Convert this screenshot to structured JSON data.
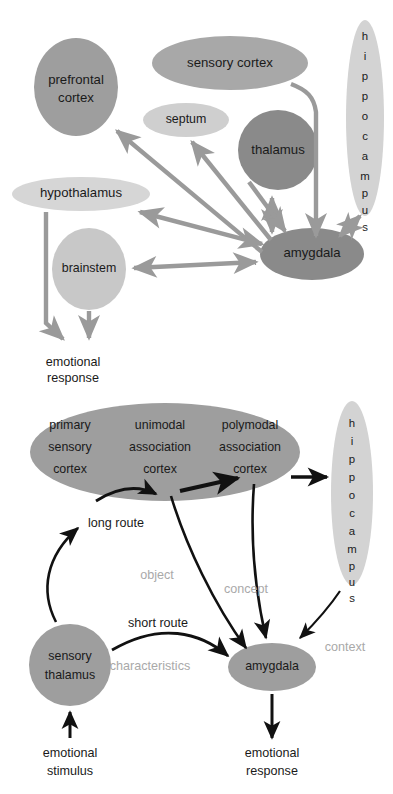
{
  "figure": {
    "panels": [
      {
        "id": "panel-top",
        "name": "limbic-circuit-panel",
        "nodes": [
          {
            "key": "prefrontal_cortex",
            "label_line1": "prefrontal",
            "label_line2": "cortex",
            "shade": "#9e9e9e"
          },
          {
            "key": "sensory_cortex",
            "label_line1": "sensory cortex",
            "label_line2": "",
            "shade": "#a8a8a8"
          },
          {
            "key": "septum",
            "label_line1": "septum",
            "label_line2": "",
            "shade": "#cfcfcf"
          },
          {
            "key": "thalamus",
            "label_line1": "thalamus",
            "label_line2": "",
            "shade": "#8a8a8a"
          },
          {
            "key": "hippocampus",
            "label_line1": "hippocampus",
            "label_line2": "",
            "shade": "#d3d3d3"
          },
          {
            "key": "hypothalamus",
            "label_line1": "hypothalamus",
            "label_line2": "",
            "shade": "#d6d6d6"
          },
          {
            "key": "brainstem",
            "label_line1": "brainstem",
            "label_line2": "",
            "shade": "#c8c8c8"
          },
          {
            "key": "amygdala",
            "label_line1": "amygdala",
            "label_line2": "",
            "shade": "#8a8a8a"
          }
        ],
        "outputs": [
          {
            "key": "emotional_response",
            "line1": "emotional",
            "line2": "response"
          }
        ],
        "arrow_color": "#9a9a9a"
      },
      {
        "id": "panel-bottom",
        "name": "dual-route-panel",
        "cortex_columns": [
          {
            "line1": "primary",
            "line2": "sensory",
            "line3": "cortex"
          },
          {
            "line1": "unimodal",
            "line2": "association",
            "line3": "cortex"
          },
          {
            "line1": "polymodal",
            "line2": "association",
            "line3": "cortex"
          }
        ],
        "nodes": [
          {
            "key": "cortex_block",
            "label": "cortex",
            "shade": "#9e9e9e"
          },
          {
            "key": "hippocampus",
            "label": "hippocampus",
            "shade": "#d3d3d3"
          },
          {
            "key": "sensory_thalamus",
            "label_line1": "sensory",
            "label_line2": "thalamus",
            "shade": "#9e9e9e"
          },
          {
            "key": "amygdala",
            "label": "amygdala",
            "shade": "#9e9e9e"
          }
        ],
        "route_labels": [
          {
            "key": "long_route",
            "text": "long route"
          },
          {
            "key": "short_route",
            "text": "short route"
          }
        ],
        "signal_labels": [
          {
            "key": "object",
            "text": "object",
            "color": "#a9a9a9"
          },
          {
            "key": "concept",
            "text": "concept",
            "color": "#a9a9a9"
          },
          {
            "key": "context",
            "text": "context",
            "color": "#a9a9a9"
          },
          {
            "key": "characteristics",
            "text": "characteristics",
            "color": "#a9a9a9"
          }
        ],
        "io_labels": [
          {
            "key": "emotional_stimulus",
            "line1": "emotional",
            "line2": "stimulus"
          },
          {
            "key": "emotional_response",
            "line1": "emotional",
            "line2": "response"
          }
        ],
        "arrow_color": "#111111"
      }
    ]
  }
}
